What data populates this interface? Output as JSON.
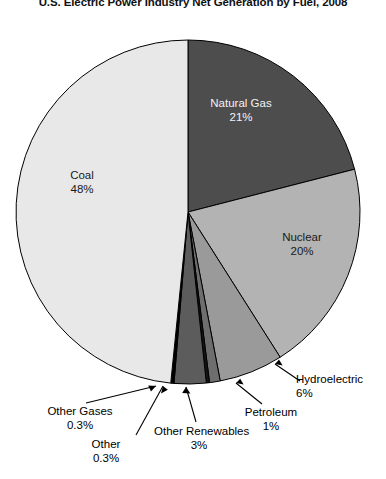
{
  "chart_title": "U.S. Electric Power Industry Net Generation by Fuel, 2008",
  "chart_data": {
    "type": "pie",
    "title": "U.S. Electric Power Industry Net Generation by Fuel, 2008",
    "xlabel": "",
    "ylabel": "",
    "legend_position": "none",
    "grid": false,
    "total": 100,
    "units": "percent of net generation",
    "categories": [
      "Coal",
      "Natural Gas",
      "Nuclear",
      "Hydroelectric",
      "Other Renewables",
      "Petroleum",
      "Other Gases",
      "Other"
    ],
    "values": [
      48,
      21,
      20,
      6,
      3,
      1,
      0.3,
      0.3
    ],
    "slices": [
      {
        "name": "Natural Gas",
        "value": 21,
        "value_label": "21%",
        "color": "#4d4d4d",
        "label_placement": "inside",
        "label_color": "#f2f2f2",
        "start_pct": 0,
        "end_pct": 21
      },
      {
        "name": "Nuclear",
        "value": 20,
        "value_label": "20%",
        "color": "#b3b3b3",
        "label_placement": "inside",
        "label_color": "#1a1a1a",
        "start_pct": 21,
        "end_pct": 41
      },
      {
        "name": "Hydroelectric",
        "value": 6,
        "value_label": "6%",
        "color": "#9a9a9a",
        "label_placement": "callout",
        "label_color": "#000000",
        "start_pct": 41,
        "end_pct": 47
      },
      {
        "name": "Petroleum",
        "value": 1,
        "value_label": "1%",
        "color": "#6e6e6e",
        "label_placement": "callout",
        "label_color": "#000000",
        "start_pct": 47,
        "end_pct": 48
      },
      {
        "name": "Other",
        "value": 0.3,
        "value_label": "0.3%",
        "color": "#141414",
        "label_placement": "callout",
        "label_color": "#000000",
        "start_pct": 48,
        "end_pct": 48.3
      },
      {
        "name": "Other Renewables",
        "value": 3,
        "value_label": "3%",
        "color": "#5c5c5c",
        "label_placement": "callout",
        "label_color": "#000000",
        "start_pct": 48.3,
        "end_pct": 51.3
      },
      {
        "name": "Other Gases",
        "value": 0.3,
        "value_label": "0.3%",
        "color": "#000000",
        "label_placement": "callout",
        "label_color": "#000000",
        "start_pct": 51.3,
        "end_pct": 51.6
      },
      {
        "name": "Coal",
        "value": 48,
        "value_label": "48%",
        "color": "#e8e8e8",
        "label_placement": "inside",
        "label_color": "#1a1a1a",
        "start_pct": 51.6,
        "end_pct": 100
      }
    ]
  },
  "labels": {
    "natural_gas": {
      "name": "Natural Gas",
      "value": "21%"
    },
    "nuclear": {
      "name": "Nuclear",
      "value": "20%"
    },
    "coal": {
      "name": "Coal",
      "value": "48%"
    },
    "hydroelectric": {
      "name": "Hydroelectric",
      "value": "6%"
    },
    "petroleum": {
      "name": "Petroleum",
      "value": "1%"
    },
    "other_renewables": {
      "name": "Other Renewables",
      "value": "3%"
    },
    "other": {
      "name": "Other",
      "value": "0.3%"
    },
    "other_gases": {
      "name": "Other Gases",
      "value": "0.3%"
    }
  },
  "colors": {
    "coal": "#e8e8e8",
    "natural_gas": "#4d4d4d",
    "nuclear": "#b3b3b3",
    "hydroelectric": "#9a9a9a",
    "other_renewables": "#5c5c5c",
    "petroleum": "#6e6e6e",
    "other_gases": "#000000",
    "other": "#141414",
    "outline": "#000000",
    "background": "#ffffff"
  }
}
